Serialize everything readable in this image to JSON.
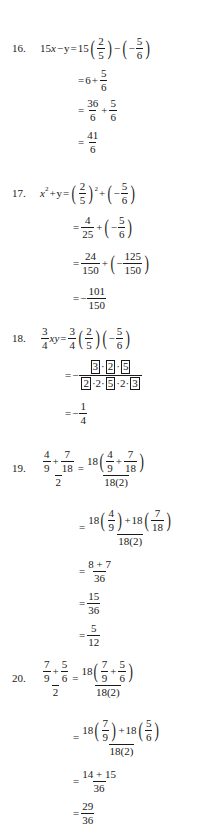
{
  "document": {
    "type": "worked-solutions",
    "problems": [
      {
        "number": "16.",
        "lhs": "15x − y",
        "steps": [
          "15(2/5) − (−5/6)",
          "6 + 5/6",
          "36/6 + 5/6",
          "41/6"
        ],
        "t": {
          "c15": "15",
          "x": "x",
          "minus": "−",
          "y": "y",
          "eq": "=",
          "n2": "2",
          "d5": "5",
          "neg": "−",
          "n5": "5",
          "d6": "6",
          "six": "6",
          "plus": "+",
          "n36": "36",
          "n41": "41"
        }
      },
      {
        "number": "17.",
        "lhs": "x^2 + y",
        "steps": [
          "(2/5)^2 + (−5/6)",
          "4/25 + (−5/6)",
          "24/150 + (−125/150)",
          "−101/150"
        ],
        "t": {
          "x": "x",
          "sq": "2",
          "plus": "+",
          "y": "y",
          "eq": "=",
          "n2": "2",
          "d5": "5",
          "neg": "−",
          "n5": "5",
          "d6": "6",
          "n4": "4",
          "d25": "25",
          "n24": "24",
          "d150": "150",
          "n125": "125",
          "n101": "101"
        }
      },
      {
        "number": "18.",
        "lhs": "(3/4)xy",
        "steps": [
          "(3/4)(2/5)(−5/6)",
          "−([3]·[2]·[5]) / ([2]·2·[5]·2·[3])",
          "−1/4"
        ],
        "t": {
          "n3": "3",
          "d4": "4",
          "xy": "xy",
          "eq": "=",
          "n2": "2",
          "d5": "5",
          "neg": "−",
          "n5": "5",
          "d6": "6",
          "dot": "·",
          "two": "2",
          "n1": "1"
        }
      },
      {
        "number": "19.",
        "lhs": "(4/9 + 7/18) / 2",
        "steps": [
          "18(4/9 + 7/18) / 18(2)",
          "[18(4/9) + 18(7/18)] / 18(2)",
          "(8 + 7)/36",
          "15/36",
          "5/12"
        ],
        "t": {
          "n4": "4",
          "d9": "9",
          "plus": "+",
          "n7": "7",
          "d18": "18",
          "two": "2",
          "eq": "=",
          "c18": "18",
          "den": "18(2)",
          "sum": "8 + 7",
          "d36": "36",
          "n15": "15",
          "n5": "5",
          "d12": "12"
        }
      },
      {
        "number": "20.",
        "lhs": "(7/9 + 5/6) / 2",
        "steps": [
          "18(7/9 + 5/6) / 18(2)",
          "[18(7/9) + 18(5/6)] / 18(2)",
          "(14 + 15)/36",
          "29/36"
        ],
        "t": {
          "n7": "7",
          "d9": "9",
          "plus": "+",
          "n5": "5",
          "d6": "6",
          "two": "2",
          "eq": "=",
          "c18": "18",
          "den": "18(2)",
          "sum": "14 + 15",
          "d36": "36",
          "n29": "29"
        }
      }
    ]
  }
}
